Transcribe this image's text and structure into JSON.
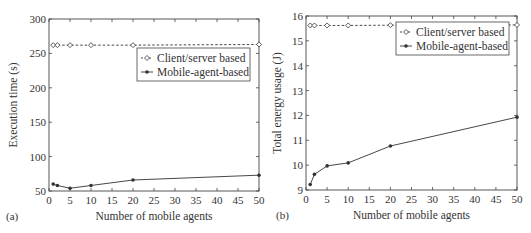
{
  "chart_data": [
    {
      "type": "line",
      "panel_label": "(a)",
      "title": "",
      "xlabel": "Number of mobile agents",
      "ylabel": "Execution time (s)",
      "xlim": [
        0,
        50
      ],
      "ylim": [
        50,
        300
      ],
      "xticks": [
        0,
        5,
        10,
        15,
        20,
        25,
        30,
        35,
        40,
        45,
        50
      ],
      "yticks": [
        50,
        100,
        150,
        200,
        250,
        300
      ],
      "grid": false,
      "legend_position": "upper right",
      "x": [
        1,
        2,
        5,
        10,
        20,
        50
      ],
      "series": [
        {
          "name": "Client/server based",
          "style": "dashed",
          "marker": "diamond",
          "values": [
            262,
            262,
            262,
            262,
            262,
            263
          ]
        },
        {
          "name": "Mobile-agent-based",
          "style": "solid",
          "marker": "filled-dot",
          "values": [
            60,
            58,
            54,
            58,
            66,
            73
          ]
        }
      ]
    },
    {
      "type": "line",
      "panel_label": "(b)",
      "title": "",
      "xlabel": "Number of mobile agents",
      "ylabel": "Total energy usage (J)",
      "xlim": [
        0,
        50
      ],
      "ylim": [
        9,
        16
      ],
      "xticks": [
        0,
        5,
        10,
        15,
        20,
        25,
        30,
        35,
        40,
        45,
        50
      ],
      "yticks": [
        9,
        10,
        11,
        12,
        13,
        14,
        15,
        16
      ],
      "grid": false,
      "legend_position": "upper right",
      "x": [
        1,
        2,
        5,
        10,
        20,
        50
      ],
      "series": [
        {
          "name": "Client/server based",
          "style": "dashed",
          "marker": "diamond",
          "values": [
            15.62,
            15.62,
            15.62,
            15.62,
            15.63,
            15.64
          ]
        },
        {
          "name": "Mobile-agent-based",
          "style": "solid",
          "marker": "filled-dot",
          "values": [
            9.22,
            9.63,
            9.97,
            10.09,
            10.77,
            11.93
          ]
        }
      ]
    }
  ],
  "colors": {
    "axis": "#444444",
    "line": "#333333",
    "background": "#ffffff"
  }
}
